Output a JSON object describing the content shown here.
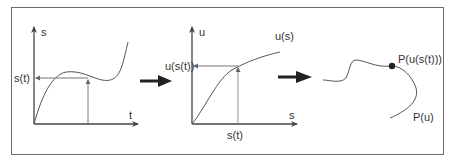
{
  "panel1": {
    "y_axis_label": "s",
    "x_axis_label": "t",
    "y_marker_label": "s(t)"
  },
  "panel2": {
    "y_axis_label": "u",
    "x_axis_label": "s",
    "curve_label": "u(s)",
    "y_marker_label": "u(s(t))",
    "x_marker_label": "s(t)"
  },
  "panel3": {
    "point_label": "P(u(s(t)))",
    "curve_label": "P(u)"
  },
  "colors": {
    "line": "#555555",
    "axis": "#444444",
    "arrow": "#222222",
    "frame": "#6a6a6a"
  }
}
